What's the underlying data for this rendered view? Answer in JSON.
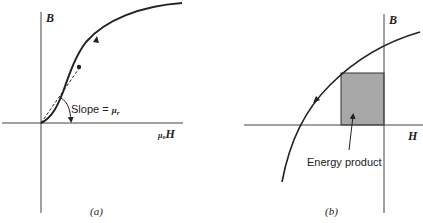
{
  "panel_a": {
    "axis_y_label": "B",
    "axis_x_label_prefix": "μ",
    "axis_x_label_sub": "o",
    "axis_x_label_main": "H",
    "slope_label": "Slope = ",
    "slope_symbol": "μ",
    "slope_sub": "r",
    "caption": "(a)"
  },
  "panel_b": {
    "axis_y_label": "B",
    "axis_x_label": "H",
    "annotation": "Energy product",
    "caption": "(b)",
    "fill_color": "#a8a8a8"
  },
  "colors": {
    "line": "#222222",
    "axis": "#444444"
  }
}
